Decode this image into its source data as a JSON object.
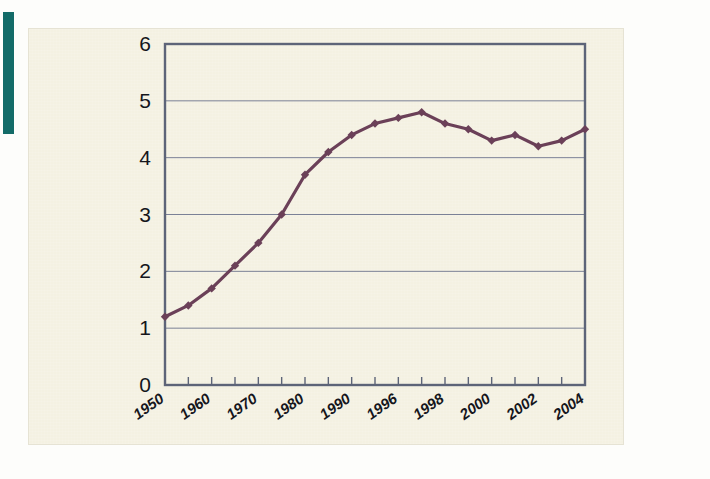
{
  "figure": {
    "accent_color": "#136b68",
    "card_background": "#f4f1e2",
    "frame_color": "#5d6478",
    "gridline_color": "#7b8196",
    "series_color": "#6b4058"
  },
  "chart_data": {
    "type": "line",
    "title": "",
    "subtitle": "",
    "xlabel": "",
    "ylabel": "",
    "grid": true,
    "legend": "none",
    "xlim": [
      1950,
      2004
    ],
    "ylim": [
      0,
      6
    ],
    "ytick_values": [
      0,
      1,
      2,
      3,
      4,
      5,
      6
    ],
    "ytick_labels": [
      "0",
      "1",
      "2",
      "3",
      "4",
      "5",
      "6"
    ],
    "xtick_labels": [
      "1950",
      "1960",
      "1970",
      "1980",
      "1990",
      "1996",
      "1998",
      "2000",
      "2002",
      "2004"
    ],
    "xtick_index": [
      0,
      2,
      4,
      6,
      8,
      10,
      12,
      14,
      16,
      18
    ],
    "x": [
      "1950",
      "1955",
      "1960",
      "1965",
      "1970",
      "1975",
      "1980",
      "1985",
      "1990",
      "1993",
      "1996",
      "1997",
      "1998",
      "1999",
      "2000",
      "2001",
      "2002",
      "2003",
      "2004"
    ],
    "values": [
      1.2,
      1.4,
      1.7,
      2.1,
      2.5,
      3.0,
      3.7,
      4.1,
      4.4,
      4.6,
      4.7,
      4.8,
      4.6,
      4.5,
      4.3,
      4.4,
      4.2,
      4.3,
      4.5
    ],
    "marker": "diamond",
    "marker_count": 19,
    "peak_value": 4.8,
    "peak_x": "1997",
    "start_value": 1.2,
    "end_value": 4.5
  }
}
